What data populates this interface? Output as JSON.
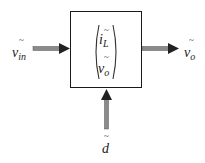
{
  "diagram": {
    "type": "block-diagram",
    "block": {
      "state_vector": [
        {
          "symbol": "i",
          "subscript": "L",
          "accent": "~"
        },
        {
          "symbol": "v",
          "subscript": "o",
          "accent": "~"
        }
      ]
    },
    "inputs": [
      {
        "id": "vin",
        "symbol": "v",
        "subscript": "in",
        "accent": "~",
        "direction": "left-to-right"
      },
      {
        "id": "d",
        "symbol": "d",
        "subscript": "",
        "accent": "~",
        "direction": "bottom-to-top"
      }
    ],
    "outputs": [
      {
        "id": "vo",
        "symbol": "v",
        "subscript": "o",
        "accent": "~",
        "direction": "left-to-right"
      }
    ],
    "colors": {
      "arrow_shaft": "#808080",
      "arrow_head": "#222222",
      "box_border": "#1a1a1a",
      "text": "#222222"
    }
  }
}
